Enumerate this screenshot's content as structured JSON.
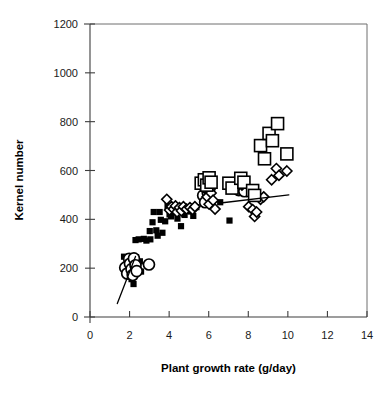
{
  "chart_data": {
    "type": "scatter",
    "title": "",
    "xlabel": "Plant growth rate (g/day)",
    "ylabel": "Kernel number",
    "xlim": [
      0,
      14
    ],
    "ylim": [
      0,
      1200
    ],
    "xticks": [
      0,
      2,
      4,
      6,
      8,
      10,
      12,
      14
    ],
    "yticks": [
      0,
      200,
      400,
      600,
      800,
      1000,
      1200
    ],
    "xtick_labels": [
      "0",
      "2",
      "4",
      "6",
      "8",
      "10",
      "12",
      "14"
    ],
    "ytick_labels": [
      "0",
      "200",
      "400",
      "600",
      "800",
      "1000",
      "1200"
    ],
    "grid": false,
    "legend": "none",
    "series": [
      {
        "name": "filled-square",
        "marker": "filled-square",
        "size": 6.2,
        "points": [
          [
            1.72,
            247
          ],
          [
            1.82,
            215
          ],
          [
            1.95,
            243
          ],
          [
            2.02,
            175
          ],
          [
            2.1,
            155
          ],
          [
            2.12,
            225
          ],
          [
            2.2,
            135
          ],
          [
            2.26,
            200
          ],
          [
            2.33,
            245
          ],
          [
            2.4,
            192
          ],
          [
            2.3,
            315
          ],
          [
            2.46,
            318
          ],
          [
            2.52,
            228
          ],
          [
            2.58,
            186
          ],
          [
            2.72,
            320
          ],
          [
            2.85,
            313
          ],
          [
            3.02,
            352
          ],
          [
            3.05,
            318
          ],
          [
            3.16,
            388
          ],
          [
            3.22,
            430
          ],
          [
            3.35,
            355
          ],
          [
            3.42,
            333
          ],
          [
            3.52,
            430
          ],
          [
            3.58,
            398
          ],
          [
            3.66,
            345
          ],
          [
            3.8,
            392
          ],
          [
            3.92,
            455
          ],
          [
            4.02,
            420
          ],
          [
            4.1,
            412
          ],
          [
            4.22,
            447
          ],
          [
            4.3,
            428
          ],
          [
            4.42,
            403
          ],
          [
            4.55,
            440
          ],
          [
            4.6,
            372
          ],
          [
            4.78,
            418
          ],
          [
            4.95,
            445
          ],
          [
            5.1,
            432
          ],
          [
            5.22,
            414
          ],
          [
            5.38,
            450
          ],
          [
            6.58,
            470
          ],
          [
            7.05,
            395
          ]
        ]
      },
      {
        "name": "open-circle",
        "marker": "open-circle",
        "size": 11,
        "points": [
          [
            1.78,
            202
          ],
          [
            1.88,
            178
          ],
          [
            1.98,
            238
          ],
          [
            2.02,
            218
          ],
          [
            2.1,
            196
          ],
          [
            2.16,
            172
          ],
          [
            2.22,
            240
          ],
          [
            2.3,
            212
          ],
          [
            2.36,
            188
          ],
          [
            2.98,
            215
          ],
          [
            5.72,
            498
          ],
          [
            5.82,
            470
          ],
          [
            5.95,
            510
          ],
          [
            6.05,
            528
          ],
          [
            7.52,
            520
          ],
          [
            7.68,
            532
          ],
          [
            7.8,
            515
          ]
        ]
      },
      {
        "name": "open-diamond",
        "marker": "open-diamond",
        "size": 9,
        "points": [
          [
            3.88,
            482
          ],
          [
            4.02,
            438
          ],
          [
            4.12,
            452
          ],
          [
            4.22,
            442
          ],
          [
            4.32,
            455
          ],
          [
            4.4,
            430
          ],
          [
            4.52,
            448
          ],
          [
            4.62,
            435
          ],
          [
            4.72,
            452
          ],
          [
            4.88,
            442
          ],
          [
            5.05,
            448
          ],
          [
            5.18,
            440
          ],
          [
            5.3,
            452
          ],
          [
            5.78,
            528
          ],
          [
            5.92,
            492
          ],
          [
            6.02,
            462
          ],
          [
            6.12,
            508
          ],
          [
            6.22,
            478
          ],
          [
            6.32,
            442
          ],
          [
            7.68,
            540
          ],
          [
            8.02,
            452
          ],
          [
            8.22,
            440
          ],
          [
            8.32,
            412
          ],
          [
            8.42,
            430
          ],
          [
            8.62,
            482
          ],
          [
            8.78,
            492
          ],
          [
            9.18,
            562
          ],
          [
            9.42,
            608
          ],
          [
            9.55,
            580
          ],
          [
            9.95,
            598
          ]
        ]
      },
      {
        "name": "open-square",
        "marker": "open-square",
        "size": 12,
        "points": [
          [
            5.62,
            548
          ],
          [
            5.78,
            562
          ],
          [
            5.9,
            540
          ],
          [
            6.02,
            570
          ],
          [
            6.12,
            552
          ],
          [
            7.02,
            548
          ],
          [
            7.18,
            528
          ],
          [
            7.62,
            568
          ],
          [
            7.78,
            552
          ],
          [
            8.22,
            518
          ],
          [
            8.32,
            498
          ],
          [
            8.62,
            702
          ],
          [
            8.82,
            648
          ],
          [
            9.05,
            752
          ],
          [
            9.22,
            722
          ],
          [
            9.48,
            792
          ],
          [
            9.95,
            668
          ]
        ]
      }
    ],
    "trend_lines": [
      {
        "name": "lower-trend",
        "x1": 1.38,
        "y1": 55,
        "x2": 2.3,
        "y2": 248
      },
      {
        "name": "upper-trend",
        "x1": 6.7,
        "y1": 468,
        "x2": 10.05,
        "y2": 500
      }
    ]
  },
  "axis": {
    "x_title": "Plant growth rate (g/day)",
    "y_title": "Kernel number"
  }
}
